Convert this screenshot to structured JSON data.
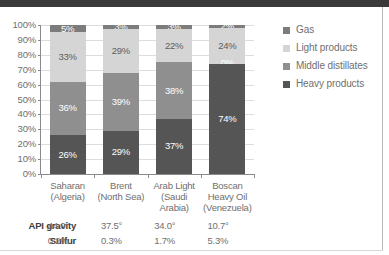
{
  "chart_data": {
    "type": "bar",
    "title": "",
    "subtitle": "",
    "stacked": true,
    "normalized": "100%",
    "xlabel": "",
    "ylabel": "",
    "ylim": [
      0,
      100
    ],
    "grid": true,
    "legend_position": "right",
    "categories": [
      "Saharan (Algeria)",
      "Brent (North Sea)",
      "Arab Light (Saudi Arabia)",
      "Boscan Heavy Oil (Venezuela)"
    ],
    "category_lines": [
      [
        "Saharan",
        "(Algeria)"
      ],
      [
        "Brent",
        "(North Sea)"
      ],
      [
        "Arab Light",
        "(Saudi",
        "Arabia)"
      ],
      [
        "Boscan",
        "Heavy Oil",
        "(Venezuela)"
      ]
    ],
    "ytick_labels": [
      "100%",
      "90%",
      "80%",
      "70%",
      "60%",
      "50%",
      "40%",
      "30%",
      "20%",
      "10%",
      "0%"
    ],
    "ytick_values": [
      100,
      90,
      80,
      70,
      60,
      50,
      40,
      30,
      20,
      10,
      0
    ],
    "series": [
      {
        "name": "Gas",
        "values": [
          5,
          3,
          3,
          2
        ],
        "labels": [
          "5%",
          "3%",
          "3%",
          "2%"
        ],
        "color": "#7c7c7c"
      },
      {
        "name": "Light products",
        "values": [
          33,
          29,
          22,
          24
        ],
        "labels": [
          "33%",
          "29%",
          "22%",
          "24%"
        ],
        "color": "#d5d5d5"
      },
      {
        "name": "Middle distillates",
        "values": [
          36,
          39,
          38,
          0
        ],
        "labels": [
          "36%",
          "39%",
          "38%",
          "0%"
        ],
        "color": "#8f8f8f"
      },
      {
        "name": "Heavy products",
        "values": [
          26,
          29,
          37,
          74
        ],
        "labels": [
          "26%",
          "29%",
          "37%",
          "74%"
        ],
        "color": "#555555"
      }
    ]
  },
  "legend": {
    "items": [
      {
        "label": "Gas",
        "color": "#7c7c7c"
      },
      {
        "label": "Light products",
        "color": "#d5d5d5"
      },
      {
        "label": "Middle distillates",
        "color": "#8f8f8f"
      },
      {
        "label": "Heavy products",
        "color": "#555555"
      }
    ]
  },
  "data_table": {
    "rows": [
      {
        "label": "API gravity",
        "values": [
          "44.0°",
          "37.5°",
          "34.0°",
          "10.7°"
        ]
      },
      {
        "label": "Sulfur",
        "values": [
          "0.2%",
          "0.3%",
          "1.7%",
          "5.3%"
        ]
      }
    ]
  }
}
